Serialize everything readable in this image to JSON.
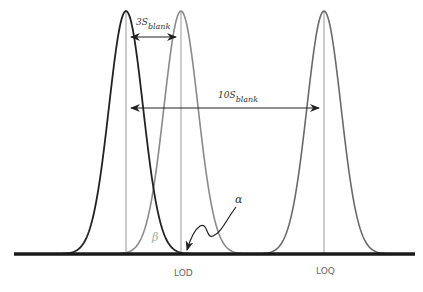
{
  "diagram": {
    "title": "",
    "colors": {
      "blank_curve": "#222222",
      "lod_curve": "#8a8a8a",
      "loq_curve": "#6a6a6a",
      "baseline": "#1a1a1a",
      "guides": "#9a9a9a"
    },
    "geometry": {
      "baseline_y": 254,
      "peak_y": 11,
      "sigma": 17,
      "x_start": 14,
      "x_end": 415
    },
    "peaks": [
      {
        "name": "blank",
        "x": 126,
        "color_key": "blank_curve"
      },
      {
        "name": "LOD",
        "x": 181,
        "color_key": "lod_curve"
      },
      {
        "name": "LOQ",
        "x": 324,
        "color_key": "loq_curve"
      }
    ],
    "labels": {
      "three_s": {
        "main": "3S",
        "sub": "blank"
      },
      "ten_s": {
        "main": "10S",
        "sub": "blank"
      },
      "alpha": "α",
      "beta": "β",
      "lod": "LOD",
      "loq": "LOQ"
    }
  }
}
